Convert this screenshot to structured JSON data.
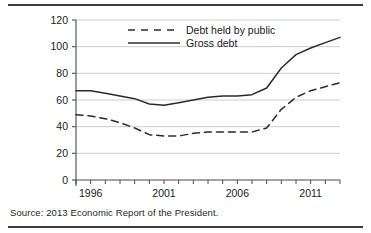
{
  "figure": {
    "source_note": "Source: 2013 Economic Report of the President.",
    "colors": {
      "line": "#2b2b2b",
      "grid": "#bfbfbf",
      "axis": "#4a4a4a",
      "text": "#1a1a1a",
      "background": "#ffffff"
    }
  },
  "chart_data": {
    "type": "line",
    "title": "",
    "subtitle": "",
    "xlabel": "",
    "ylabel": "",
    "xlim": [
      1995,
      2013
    ],
    "ylim": [
      0,
      120
    ],
    "grid": true,
    "legend_position": "top-center",
    "y_ticks": [
      0,
      20,
      40,
      60,
      80,
      100,
      120
    ],
    "y_tick_labels": [
      "0",
      "20",
      "40",
      "60",
      "80",
      "100",
      "120"
    ],
    "x_ticks": [
      1995,
      1996,
      1997,
      1998,
      1999,
      2000,
      2001,
      2002,
      2003,
      2004,
      2005,
      2006,
      2007,
      2008,
      2009,
      2010,
      2011,
      2012,
      2013
    ],
    "x_tick_labels_shown": [
      "1996",
      "2001",
      "2006",
      "2011"
    ],
    "x_labeled_ticks": [
      1996,
      2001,
      2006,
      2011
    ],
    "x": [
      1995,
      1996,
      1997,
      1998,
      1999,
      2000,
      2001,
      2002,
      2003,
      2004,
      2005,
      2006,
      2007,
      2008,
      2009,
      2010,
      2011,
      2012,
      2013
    ],
    "series": [
      {
        "name": "Debt held by public",
        "style": "dashed",
        "values": [
          49,
          48,
          46,
          43,
          39,
          34,
          33,
          33,
          35,
          36,
          36,
          36,
          36,
          39,
          53,
          62,
          67,
          70,
          73
        ]
      },
      {
        "name": "Gross debt",
        "style": "solid",
        "values": [
          67,
          67,
          65,
          63,
          61,
          57,
          56,
          58,
          60,
          62,
          63,
          63,
          64,
          69,
          84,
          94,
          99,
          103,
          107
        ]
      }
    ]
  }
}
